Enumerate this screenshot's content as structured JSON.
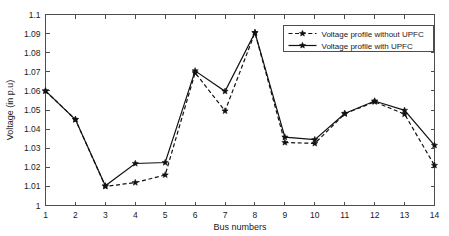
{
  "chart_data": {
    "type": "line",
    "title": "",
    "xlabel": "Bus numbers",
    "ylabel": "Voltage (in p.u)",
    "x": [
      1,
      2,
      3,
      4,
      5,
      6,
      7,
      8,
      9,
      10,
      11,
      12,
      13,
      14
    ],
    "xticklabels": [
      "1",
      "2",
      "3",
      "4",
      "5",
      "6",
      "7",
      "8",
      "9",
      "10",
      "11",
      "12",
      "13",
      "14"
    ],
    "yticklabels": [
      "1",
      "1.01",
      "1.02",
      "1.03",
      "1.04",
      "1.05",
      "1.06",
      "1.07",
      "1.08",
      "1.09",
      "1.1"
    ],
    "ytickvalues": [
      1,
      1.01,
      1.02,
      1.03,
      1.04,
      1.05,
      1.06,
      1.07,
      1.08,
      1.09,
      1.1
    ],
    "xlim": [
      1,
      14
    ],
    "ylim": [
      1,
      1.1
    ],
    "grid": false,
    "legend_position": "top-right",
    "series": [
      {
        "name": "Voltage profile without UPFC",
        "style": "dashed",
        "marker": "star",
        "color": "#111111",
        "values": [
          1.06,
          1.045,
          1.01,
          1.012,
          1.016,
          1.0695,
          1.0495,
          1.0905,
          1.033,
          1.0325,
          1.048,
          1.0543,
          1.0478,
          1.021
        ]
      },
      {
        "name": "Voltage profile with UPFC",
        "style": "solid",
        "marker": "star",
        "color": "#111111",
        "values": [
          1.06,
          1.045,
          1.0103,
          1.022,
          1.0225,
          1.0705,
          1.0598,
          1.0905,
          1.0358,
          1.0345,
          1.0482,
          1.0547,
          1.0498,
          1.0315
        ]
      }
    ]
  }
}
